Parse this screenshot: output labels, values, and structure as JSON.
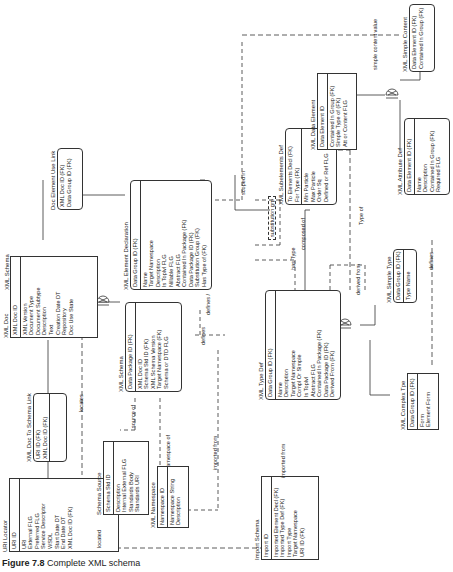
{
  "diagram_title": "XML Schema",
  "caption": {
    "figure": "Figure 7.8",
    "text": "Complete XML schema"
  },
  "entities": {
    "uri_locator": {
      "name": "URI Locator",
      "keys": [
        "URI ID"
      ],
      "attrs": [
        "URI",
        "External FLG",
        "Preferred FLG",
        "Service Descriptor",
        "WSDL",
        "Start Date DT",
        "End Date DT",
        "XML Doc ID (FK)"
      ]
    },
    "doc_to_schema_link": {
      "name": "XML Doc To Schema Link",
      "keys": [
        "URI ID (FK)",
        "XML Doc ID (FK)"
      ],
      "attrs": []
    },
    "xml_doc": {
      "name": "XML Doc",
      "keys": [
        "XML Doc ID"
      ],
      "attrs": [
        "XML Version",
        "Document Type",
        "Document Subtype",
        "Description",
        "Text",
        "Creation Date DT",
        "Repository",
        "Doc Use State"
      ]
    },
    "doc_element_use_link": {
      "name": "Doc Element Use Link",
      "keys": [
        "XML Doc ID (FK)",
        "Data Group ID (FK)"
      ],
      "attrs": []
    },
    "schema_source": {
      "name": "Schema Source",
      "keys": [
        "Schema Std ID"
      ],
      "attrs": [
        "Description",
        "Internal External FLG",
        "Standards Body",
        "Standards URI"
      ]
    },
    "xml_schema": {
      "name": "XML Schema",
      "keys": [
        "Data Package ID (FK)"
      ],
      "attrs": [
        "XML Doc ID",
        "Schema Std ID (FK)",
        "XML Schema Version",
        "Target Namespace (FK)",
        "Schema or DTD FLG"
      ]
    },
    "xml_namespace": {
      "name": "XML Namespace",
      "keys": [
        "Namespace ID"
      ],
      "attrs": [
        "Namespace String",
        "Description"
      ]
    },
    "xml_element_declaration": {
      "name": "XML Element Declaration",
      "keys": [
        "Data Group ID (FK)"
      ],
      "attrs": [
        "Name",
        "Target Namespace",
        "Description",
        "Is Toplvl FLG",
        "Nillable FLG",
        "Abstract FLG",
        "Contained In Package (FK)",
        "Data Package ID (FK)",
        "Substitution Group (FK)",
        "Has Type of (FK)"
      ]
    },
    "import_schema": {
      "name": "Import Schema",
      "keys": [
        "Import ID"
      ],
      "attrs": [
        "Imported Element Decl (FK)",
        "Imported Type Def (FK)",
        "Import Type",
        "Target Namespace",
        "URI ID (FK)"
      ]
    },
    "xml_type_def": {
      "name": "XML Type Def",
      "keys": [
        "Data Group ID (FK)"
      ],
      "attrs": [
        "Name",
        "Description",
        "Target Namespace",
        "Compl Or Simple",
        "Is Toplvl",
        "Abstract FLG",
        "Contained In Package (FK)",
        "Data Package ID (FK)",
        "Derived From (FK)"
      ]
    },
    "xml_subelements_def": {
      "name": "XML Subelements Def",
      "keys": [
        "To Elements Decl (FK)",
        "For Type (FK)"
      ],
      "attrs": [
        "Min Particle",
        "Max Particle",
        "Order Sq",
        "Defined or Ref FLG"
      ]
    },
    "xml_data_element": {
      "name": "XML Data Element",
      "keys": [
        "Data Element ID"
      ],
      "attrs": [
        "Contained In Group (FK)",
        "Simple Type of (FK)",
        "Att or Content FLG"
      ]
    },
    "xml_simple_content": {
      "name": "XML Simple Content",
      "keys": [
        "Data Element ID (FK)",
        "Contained In Group (FK)"
      ],
      "attrs": []
    },
    "xml_attribute_def": {
      "name": "XML Attribute Def",
      "keys": [
        "Data Element ID (FK)"
      ],
      "attrs": [
        "Name",
        "Description",
        "Contained In Group (FK)",
        "Required FLG"
      ]
    },
    "xml_simple_type": {
      "name": "XML Simple Type",
      "keys": [
        "Data Group ID (FK)"
      ],
      "attrs": [
        "Type Name"
      ]
    },
    "xml_complex_type": {
      "name": "XML Complex Tpe",
      "keys": [
        "Data Group ID (FK)"
      ],
      "attrs": [
        "Form",
        "Element Form"
      ]
    }
  },
  "relationships": {
    "locates": "locates",
    "located": "located",
    "source_of": "source of",
    "namespace_of": "namespace of",
    "imported_from_1": "imported from",
    "imported_from_2": "imported from",
    "defines_1": "defines",
    "defines_2": "defines /",
    "defines_3": "defines",
    "scoped_in": "scoped in",
    "substitution_grp": "substitution grp",
    "has_type": "has Type",
    "composed_of": "composed of",
    "type_of": "Type of",
    "derived_from": "derived from",
    "simple_content_value": "simple content value"
  }
}
